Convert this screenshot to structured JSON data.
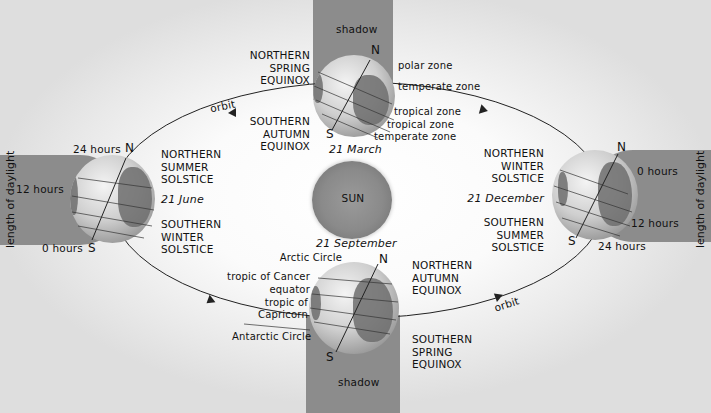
{
  "diagram": {
    "center": {
      "label": "SUN"
    },
    "orbit_labels": [
      "orbit",
      "orbit"
    ],
    "positions": {
      "top": {
        "date": "21 March",
        "north_label": [
          "NORTHERN",
          "SPRING",
          "EQUINOX"
        ],
        "south_label": [
          "SOUTHERN",
          "AUTUMN",
          "EQUINOX"
        ],
        "shadow_label": "shadow",
        "pole_n": "N",
        "pole_s": "S",
        "zones": [
          "polar zone",
          "temperate zone",
          "tropical zone",
          "tropical zone",
          "temperate zone"
        ]
      },
      "left": {
        "date": "21 June",
        "north_label": [
          "NORTHERN",
          "SUMMER",
          "SOLSTICE"
        ],
        "south_label": [
          "SOUTHERN",
          "WINTER",
          "SOLSTICE"
        ],
        "pole_n": "N",
        "pole_s": "S",
        "daylight_axis": "length of daylight",
        "daylight_marks": [
          "24 hours",
          "12 hours",
          "0 hours"
        ]
      },
      "right": {
        "date": "21 December",
        "north_label": [
          "NORTHERN",
          "WINTER",
          "SOLSTICE"
        ],
        "south_label": [
          "SOUTHERN",
          "SUMMER",
          "SOLSTICE"
        ],
        "pole_n": "N",
        "pole_s": "S",
        "daylight_axis": "length of daylight",
        "daylight_marks": [
          "0 hours",
          "12 hours",
          "24 hours"
        ]
      },
      "bottom": {
        "date": "21 September",
        "north_label": [
          "NORTHERN",
          "AUTUMN",
          "EQUINOX"
        ],
        "south_label": [
          "SOUTHERN",
          "SPRING",
          "EQUINOX"
        ],
        "shadow_label": "shadow",
        "pole_n": "N",
        "pole_s": "S",
        "circles": [
          "Arctic Circle",
          "tropic of Cancer",
          "equator",
          "tropic of",
          "Capricorn",
          "Antarctic Circle"
        ]
      }
    },
    "colors": {
      "shadow": "#8c8c8c",
      "background": "#f2f2f2",
      "sun": "#8f8f8f",
      "orbit_line": "#222222"
    }
  }
}
